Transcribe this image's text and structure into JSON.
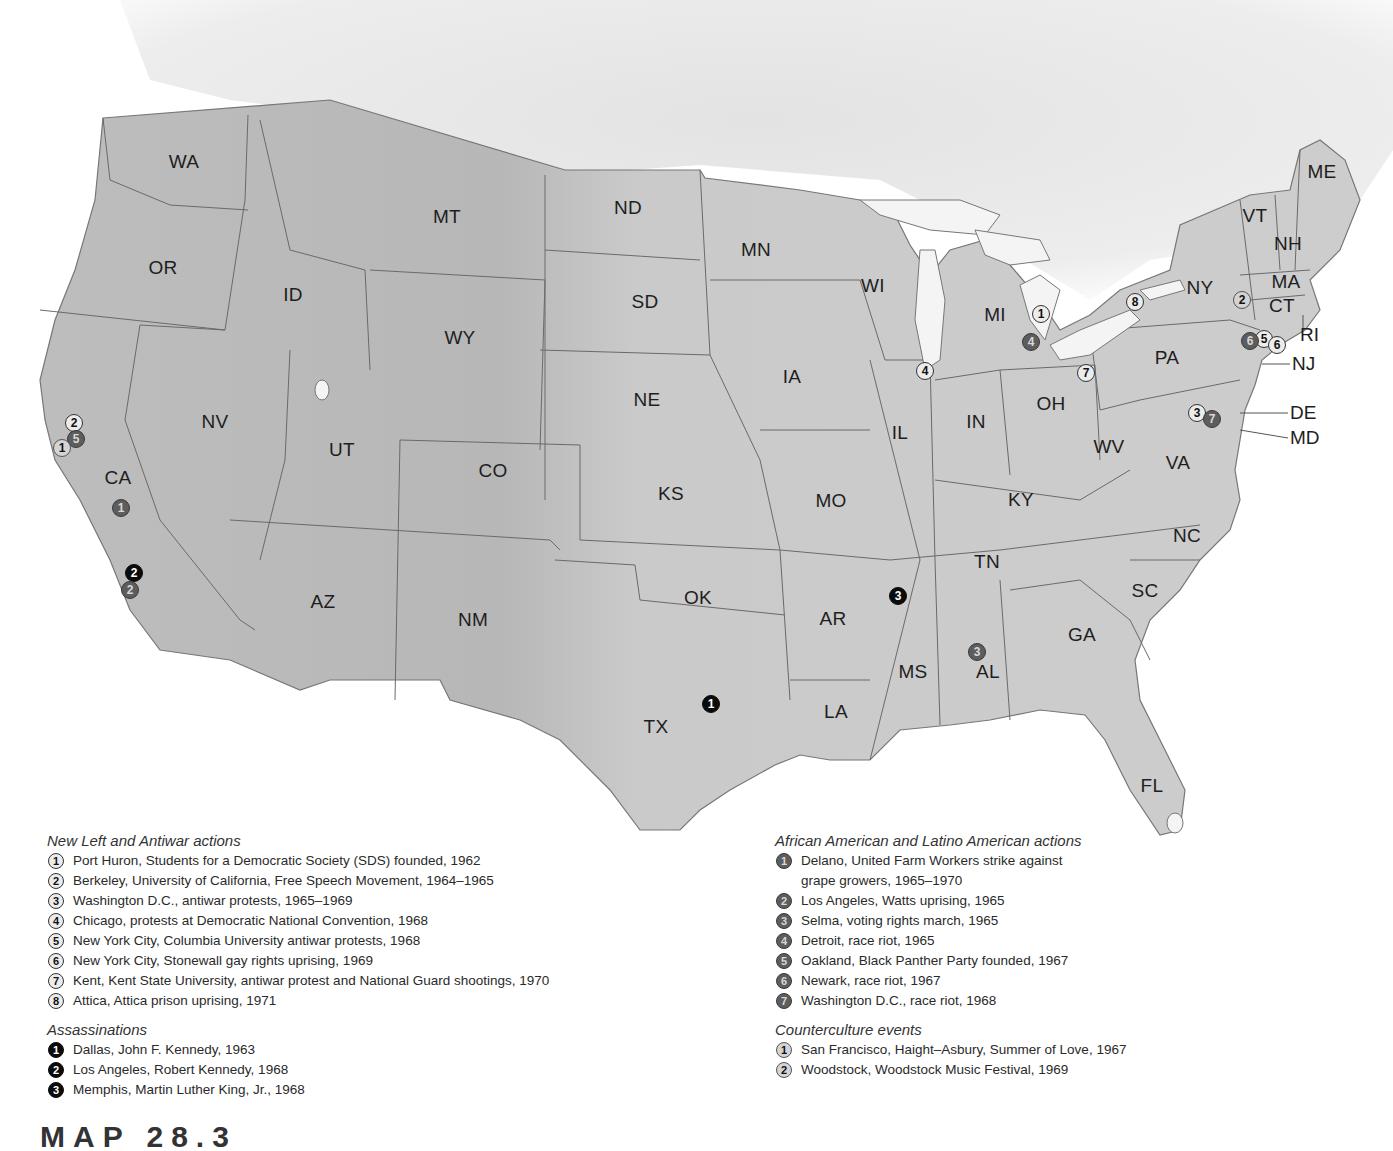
{
  "map": {
    "subject": "United States protest, assassination, and counterculture events, 1960s–1970s",
    "colors": {
      "land": "#c9c9c9",
      "land_relief": "#b5b5b5",
      "canada": "#e2e2e2",
      "water": "#ffffff",
      "border": "#6a6a6a",
      "new_left_marker": "#ececec",
      "assassination_marker": "#0b0b0b",
      "civil_rights_marker": "#5d5d5d",
      "counterculture_marker": "#d4d4d4"
    },
    "state_labels": [
      {
        "abbr": "WA",
        "x": 184,
        "y": 162
      },
      {
        "abbr": "OR",
        "x": 163,
        "y": 268
      },
      {
        "abbr": "ID",
        "x": 293,
        "y": 295
      },
      {
        "abbr": "MT",
        "x": 447,
        "y": 217
      },
      {
        "abbr": "WY",
        "x": 460,
        "y": 338
      },
      {
        "abbr": "NV",
        "x": 215,
        "y": 422
      },
      {
        "abbr": "UT",
        "x": 342,
        "y": 450
      },
      {
        "abbr": "CO",
        "x": 493,
        "y": 471
      },
      {
        "abbr": "CA",
        "x": 118,
        "y": 478
      },
      {
        "abbr": "AZ",
        "x": 323,
        "y": 602
      },
      {
        "abbr": "NM",
        "x": 473,
        "y": 620
      },
      {
        "abbr": "ND",
        "x": 628,
        "y": 208
      },
      {
        "abbr": "SD",
        "x": 645,
        "y": 302
      },
      {
        "abbr": "NE",
        "x": 647,
        "y": 400
      },
      {
        "abbr": "KS",
        "x": 671,
        "y": 494
      },
      {
        "abbr": "OK",
        "x": 698,
        "y": 598
      },
      {
        "abbr": "TX",
        "x": 656,
        "y": 727
      },
      {
        "abbr": "MN",
        "x": 756,
        "y": 250
      },
      {
        "abbr": "IA",
        "x": 792,
        "y": 377
      },
      {
        "abbr": "MO",
        "x": 831,
        "y": 501
      },
      {
        "abbr": "AR",
        "x": 833,
        "y": 619
      },
      {
        "abbr": "LA",
        "x": 836,
        "y": 712
      },
      {
        "abbr": "WI",
        "x": 873,
        "y": 286
      },
      {
        "abbr": "IL",
        "x": 900,
        "y": 433
      },
      {
        "abbr": "MS",
        "x": 913,
        "y": 672
      },
      {
        "abbr": "MI",
        "x": 995,
        "y": 315
      },
      {
        "abbr": "IN",
        "x": 976,
        "y": 422
      },
      {
        "abbr": "KY",
        "x": 1021,
        "y": 500
      },
      {
        "abbr": "TN",
        "x": 987,
        "y": 562
      },
      {
        "abbr": "AL",
        "x": 988,
        "y": 672
      },
      {
        "abbr": "OH",
        "x": 1051,
        "y": 404
      },
      {
        "abbr": "GA",
        "x": 1082,
        "y": 635
      },
      {
        "abbr": "WV",
        "x": 1109,
        "y": 447
      },
      {
        "abbr": "VA",
        "x": 1178,
        "y": 463
      },
      {
        "abbr": "NC",
        "x": 1187,
        "y": 536
      },
      {
        "abbr": "SC",
        "x": 1145,
        "y": 591
      },
      {
        "abbr": "FL",
        "x": 1152,
        "y": 786
      },
      {
        "abbr": "PA",
        "x": 1167,
        "y": 358
      },
      {
        "abbr": "NY",
        "x": 1200,
        "y": 288
      },
      {
        "abbr": "VT",
        "x": 1255,
        "y": 216
      },
      {
        "abbr": "NH",
        "x": 1288,
        "y": 244
      },
      {
        "abbr": "ME",
        "x": 1322,
        "y": 172
      },
      {
        "abbr": "MA",
        "x": 1286,
        "y": 282
      },
      {
        "abbr": "CT",
        "x": 1282,
        "y": 306
      }
    ],
    "callout_labels": [
      {
        "abbr": "RI",
        "x": 1300,
        "y": 335
      },
      {
        "abbr": "NJ",
        "x": 1292,
        "y": 364
      },
      {
        "abbr": "DE",
        "x": 1290,
        "y": 413
      },
      {
        "abbr": "MD",
        "x": 1290,
        "y": 438
      }
    ],
    "markers": [
      {
        "category": "new_left",
        "num": "1",
        "x": 1041,
        "y": 314,
        "place": "Port Huron"
      },
      {
        "category": "new_left",
        "num": "2",
        "x": 74,
        "y": 423,
        "place": "Berkeley"
      },
      {
        "category": "new_left",
        "num": "3",
        "x": 1197,
        "y": 413,
        "place": "Washington D.C."
      },
      {
        "category": "new_left",
        "num": "4",
        "x": 925,
        "y": 371,
        "place": "Chicago"
      },
      {
        "category": "new_left",
        "num": "5",
        "x": 1264,
        "y": 339,
        "place": "New York City (Columbia)"
      },
      {
        "category": "new_left",
        "num": "6",
        "x": 1277,
        "y": 345,
        "place": "New York City (Stonewall)"
      },
      {
        "category": "new_left",
        "num": "7",
        "x": 1086,
        "y": 373,
        "place": "Kent"
      },
      {
        "category": "new_left",
        "num": "8",
        "x": 1135,
        "y": 302,
        "place": "Attica"
      },
      {
        "category": "assassination",
        "num": "1",
        "x": 711,
        "y": 704,
        "place": "Dallas"
      },
      {
        "category": "assassination",
        "num": "2",
        "x": 134,
        "y": 573,
        "place": "Los Angeles"
      },
      {
        "category": "assassination",
        "num": "3",
        "x": 898,
        "y": 596,
        "place": "Memphis"
      },
      {
        "category": "civil",
        "num": "1",
        "x": 121,
        "y": 508,
        "place": "Delano"
      },
      {
        "category": "civil",
        "num": "2",
        "x": 130,
        "y": 590,
        "place": "Los Angeles"
      },
      {
        "category": "civil",
        "num": "3",
        "x": 977,
        "y": 652,
        "place": "Selma"
      },
      {
        "category": "civil",
        "num": "4",
        "x": 1031,
        "y": 342,
        "place": "Detroit"
      },
      {
        "category": "civil",
        "num": "5",
        "x": 76,
        "y": 439,
        "place": "Oakland"
      },
      {
        "category": "civil",
        "num": "6",
        "x": 1250,
        "y": 341,
        "place": "Newark"
      },
      {
        "category": "civil",
        "num": "7",
        "x": 1212,
        "y": 419,
        "place": "Washington D.C."
      },
      {
        "category": "counter",
        "num": "1",
        "x": 62,
        "y": 448,
        "place": "San Francisco"
      },
      {
        "category": "counter",
        "num": "2",
        "x": 1242,
        "y": 300,
        "place": "Woodstock"
      }
    ]
  },
  "legend": {
    "new_left": {
      "title": "New Left and Antiwar actions",
      "items": [
        {
          "num": "1",
          "text": "Port Huron, Students for a Democratic Society (SDS) founded, 1962"
        },
        {
          "num": "2",
          "text": "Berkeley, University of California, Free Speech Movement, 1964–1965"
        },
        {
          "num": "3",
          "text": "Washington D.C., antiwar protests, 1965–1969"
        },
        {
          "num": "4",
          "text": "Chicago, protests at Democratic National Convention, 1968"
        },
        {
          "num": "5",
          "text": "New York City, Columbia University antiwar protests, 1968"
        },
        {
          "num": "6",
          "text": "New York City, Stonewall gay rights uprising, 1969"
        },
        {
          "num": "7",
          "text": "Kent, Kent State University, antiwar protest and National Guard shootings, 1970"
        },
        {
          "num": "8",
          "text": "Attica, Attica prison uprising, 1971"
        }
      ]
    },
    "assassinations": {
      "title": "Assassinations",
      "items": [
        {
          "num": "1",
          "text": "Dallas, John F. Kennedy, 1963"
        },
        {
          "num": "2",
          "text": "Los Angeles, Robert Kennedy, 1968"
        },
        {
          "num": "3",
          "text": "Memphis, Martin Luther King, Jr., 1968"
        }
      ]
    },
    "civil": {
      "title": "African American and Latino American actions",
      "items": [
        {
          "num": "1",
          "text": "Delano, United Farm Workers strike against\ngrape growers, 1965–1970"
        },
        {
          "num": "2",
          "text": "Los Angeles, Watts uprising, 1965"
        },
        {
          "num": "3",
          "text": "Selma, voting rights march, 1965"
        },
        {
          "num": "4",
          "text": "Detroit, race riot, 1965"
        },
        {
          "num": "5",
          "text": "Oakland, Black Panther Party founded, 1967"
        },
        {
          "num": "6",
          "text": "Newark, race riot, 1967"
        },
        {
          "num": "7",
          "text": "Washington D.C., race riot, 1968"
        }
      ]
    },
    "counter": {
      "title": "Counterculture events",
      "items": [
        {
          "num": "1",
          "text": "San Francisco, Haight–Asbury, Summer of Love, 1967"
        },
        {
          "num": "2",
          "text": "Woodstock, Woodstock Music Festival, 1969"
        }
      ]
    }
  },
  "bottom_heading": "MAP 28.3"
}
